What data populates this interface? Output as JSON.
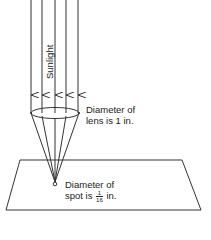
{
  "diagram": {
    "type": "optics-lens-focusing",
    "ray_label": "Sunlight",
    "ray_count": 5,
    "lens_label": {
      "line1": "Diameter of",
      "line2": "lens is 1 in."
    },
    "spot_label": {
      "line1": "Diameter of",
      "line2_prefix": "spot is",
      "fraction_numerator": "1",
      "fraction_denominator": "16",
      "line2_suffix": "in."
    },
    "colors": {
      "line": "#333333",
      "background": "#ffffff"
    }
  }
}
